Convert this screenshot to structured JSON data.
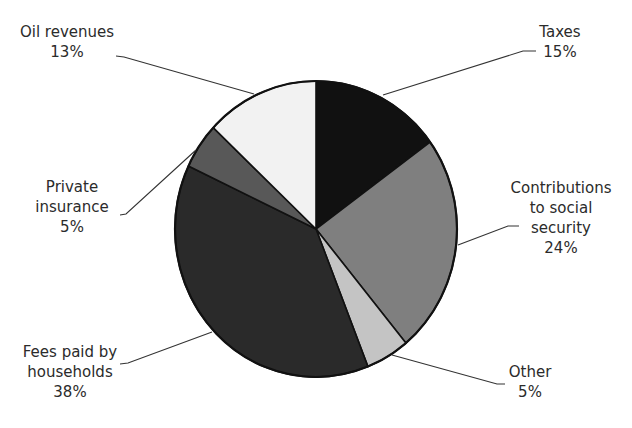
{
  "chart_data": {
    "type": "pie",
    "title": "",
    "start_angle_deg": 0,
    "direction": "clockwise",
    "slices": [
      {
        "label": "Taxes",
        "value": 15,
        "pct_label": "15%",
        "color": "#111111"
      },
      {
        "label": "Contributions to social security",
        "value": 24,
        "pct_label": "24%",
        "color": "#7f7f7f"
      },
      {
        "label": "Other",
        "value": 5,
        "pct_label": "5%",
        "color": "#c4c4c4"
      },
      {
        "label": "Fees paid by households",
        "value": 38,
        "pct_label": "38%",
        "color": "#2a2a2a"
      },
      {
        "label": "Private insurance",
        "value": 5,
        "pct_label": "5%",
        "color": "#585858"
      },
      {
        "label": "Oil revenues",
        "value": 13,
        "pct_label": "13%",
        "color": "#f2f2f2"
      }
    ]
  },
  "labels": {
    "taxes": {
      "line1": "Taxes",
      "pct": "15%"
    },
    "contributions": {
      "line1": "Contributions",
      "line2": "to social",
      "line3": "security",
      "pct": "24%"
    },
    "other": {
      "line1": "Other",
      "pct": "5%"
    },
    "fees": {
      "line1": "Fees paid by",
      "line2": "households",
      "pct": "38%"
    },
    "private": {
      "line1": "Private",
      "line2": "insurance",
      "pct": "5%"
    },
    "oil": {
      "line1": "Oil revenues",
      "pct": "13%"
    }
  }
}
